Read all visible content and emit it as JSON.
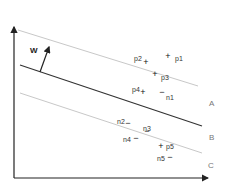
{
  "diagram": {
    "type": "svm-margin-diagram",
    "axes": {
      "x_axis": "arrow-right",
      "y_axis": "arrow-up",
      "stroke": "#222222"
    },
    "weight_vector": {
      "label": "W",
      "from": [
        40,
        72
      ],
      "to": [
        49,
        47
      ]
    },
    "lines": [
      {
        "id": "A",
        "label": "A",
        "x1": 18,
        "y1": 30,
        "x2": 198,
        "y2": 86,
        "color": "#c8c8c8",
        "width": 1
      },
      {
        "id": "B",
        "label": "B",
        "x1": 20,
        "y1": 65,
        "x2": 202,
        "y2": 126,
        "color": "#333333",
        "width": 1.2
      },
      {
        "id": "C",
        "label": "C",
        "x1": 20,
        "y1": 93,
        "x2": 202,
        "y2": 153,
        "color": "#c8c8c8",
        "width": 1
      }
    ],
    "line_labels": [
      {
        "text": "A",
        "x": 209,
        "y": 100
      },
      {
        "text": "B",
        "x": 209,
        "y": 134
      },
      {
        "text": "C",
        "x": 208,
        "y": 162
      }
    ],
    "points": [
      {
        "name": "p1",
        "symbol": "+",
        "x": 168,
        "y": 56,
        "lx": 175,
        "ly": 55
      },
      {
        "name": "p2",
        "symbol": "+",
        "x": 146,
        "y": 62,
        "lx": 134,
        "ly": 55
      },
      {
        "name": "p3",
        "symbol": "+",
        "x": 155,
        "y": 74,
        "lx": 161,
        "ly": 74
      },
      {
        "name": "p4",
        "symbol": "+",
        "x": 143,
        "y": 92,
        "lx": 132,
        "ly": 86
      },
      {
        "name": "n1",
        "symbol": "−",
        "x": 162,
        "y": 92,
        "lx": 166,
        "ly": 94
      },
      {
        "name": "n2",
        "symbol": "−",
        "x": 128,
        "y": 123,
        "lx": 117,
        "ly": 118
      },
      {
        "name": "n3",
        "symbol": "−",
        "x": 147,
        "y": 131,
        "lx": 143,
        "ly": 125
      },
      {
        "name": "n4",
        "symbol": "−",
        "x": 136,
        "y": 138,
        "lx": 123,
        "ly": 136
      },
      {
        "name": "p5",
        "symbol": "+",
        "x": 161,
        "y": 146,
        "lx": 166,
        "ly": 143
      },
      {
        "name": "n5",
        "symbol": "−",
        "x": 170,
        "y": 157,
        "lx": 157,
        "ly": 155
      }
    ]
  }
}
